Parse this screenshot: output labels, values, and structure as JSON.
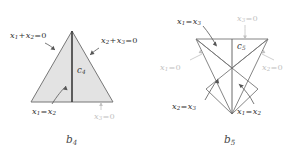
{
  "figure": {
    "background_color": "#ffffff",
    "line_color": "#6f6f6f",
    "fill_color": "#e3e3e3",
    "label_color": "#333333",
    "muted_label_color": "#c2c2c2",
    "panels": [
      {
        "caption": "b",
        "caption_sub": "4",
        "cell_label": "c",
        "cell_label_sub": "4",
        "labels": [
          {
            "name": "left-edge-equation",
            "text": "x",
            "sub1": "1",
            "op": "+",
            "text2": "x",
            "sub2": "2",
            "tail": "=0",
            "muted": false
          },
          {
            "name": "right-edge-equation",
            "text": "x",
            "sub1": "2",
            "op": "+",
            "text2": "x",
            "sub2": "3",
            "tail": "=0",
            "muted": false
          },
          {
            "name": "median-equation",
            "text": "x",
            "sub1": "1",
            "op": "=",
            "text2": "x",
            "sub2": "2",
            "tail": "",
            "muted": false
          },
          {
            "name": "base-equation",
            "text": "x",
            "sub1": "3",
            "op": "",
            "text2": "",
            "sub2": "",
            "tail": "=0",
            "muted": true
          }
        ]
      },
      {
        "caption": "b",
        "caption_sub": "5",
        "cell_label": "c",
        "cell_label_sub": "5",
        "labels": [
          {
            "name": "upper-left-equation",
            "text": "x",
            "sub1": "1",
            "op": "=",
            "text2": "x",
            "sub2": "3",
            "tail": "",
            "muted": false
          },
          {
            "name": "upper-right-equation",
            "text": "x",
            "sub1": "3",
            "op": "",
            "text2": "",
            "sub2": "",
            "tail": "=0",
            "muted": true
          },
          {
            "name": "left-equation",
            "text": "x",
            "sub1": "1",
            "op": "",
            "text2": "",
            "sub2": "",
            "tail": "=0",
            "muted": true
          },
          {
            "name": "right-equation",
            "text": "x",
            "sub1": "2",
            "op": "",
            "text2": "",
            "sub2": "",
            "tail": "=0",
            "muted": true
          },
          {
            "name": "lower-left-equation",
            "text": "x",
            "sub1": "2",
            "op": "=",
            "text2": "x",
            "sub2": "3",
            "tail": "",
            "muted": false
          },
          {
            "name": "lower-right-equation",
            "text": "x",
            "sub1": "1",
            "op": "=",
            "text2": "x",
            "sub2": "2",
            "tail": "",
            "muted": false
          }
        ]
      }
    ]
  },
  "labels": {
    "p1_left": {
      "a": "x",
      "s1": "1",
      "op": "+",
      "b": "x",
      "s2": "2",
      "tail": "=0"
    },
    "p1_right": {
      "a": "x",
      "s1": "2",
      "op": "+",
      "b": "x",
      "s2": "3",
      "tail": "=0"
    },
    "p1_median": {
      "a": "x",
      "s1": "1",
      "op": "=",
      "b": "x",
      "s2": "2",
      "tail": ""
    },
    "p1_base": {
      "a": "x",
      "s1": "3",
      "op": "",
      "b": "",
      "s2": "",
      "tail": "=0"
    },
    "p1_cell": {
      "a": "c",
      "s1": "4"
    },
    "p1_caption": {
      "a": "b",
      "s1": "4"
    },
    "p2_ul": {
      "a": "x",
      "s1": "1",
      "op": "=",
      "b": "x",
      "s2": "3",
      "tail": ""
    },
    "p2_ur": {
      "a": "x",
      "s1": "3",
      "op": "",
      "b": "",
      "s2": "",
      "tail": "=0"
    },
    "p2_left": {
      "a": "x",
      "s1": "1",
      "op": "",
      "b": "",
      "s2": "",
      "tail": "=0"
    },
    "p2_right": {
      "a": "x",
      "s1": "2",
      "op": "",
      "b": "",
      "s2": "",
      "tail": "=0"
    },
    "p2_ll": {
      "a": "x",
      "s1": "2",
      "op": "=",
      "b": "x",
      "s2": "3",
      "tail": ""
    },
    "p2_lr": {
      "a": "x",
      "s1": "1",
      "op": "=",
      "b": "x",
      "s2": "2",
      "tail": ""
    },
    "p2_cell": {
      "a": "c",
      "s1": "5"
    },
    "p2_caption": {
      "a": "b",
      "s1": "5"
    }
  }
}
